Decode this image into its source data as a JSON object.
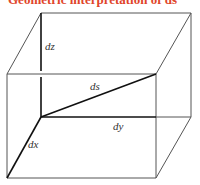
{
  "title": "Geometric interpretation of ds",
  "colors": {
    "title": "#e0452a",
    "thin_line": "#555555",
    "bold_line": "#111111"
  },
  "labels": {
    "dz": "dz",
    "ds": "ds",
    "dy": "dy",
    "dx": "dx"
  },
  "box": {
    "back_top_left": [
      41,
      13
    ],
    "back_top_right": [
      191,
      13
    ],
    "back_bottom_left": [
      41,
      117
    ],
    "back_bottom_right": [
      191,
      117
    ],
    "front_top_left": [
      7,
      74
    ],
    "front_top_right": [
      156,
      74
    ],
    "front_bottom_left": [
      7,
      178
    ],
    "front_bottom_right": [
      156,
      178
    ]
  }
}
